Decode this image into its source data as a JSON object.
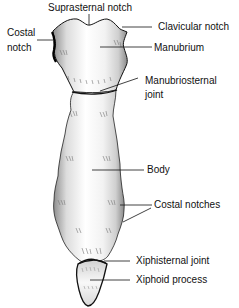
{
  "diagram": {
    "labels": {
      "suprasternal_notch": "Suprasternal notch",
      "clavicular_notch": "Clavicular notch",
      "costal_notch_line1": "Costal",
      "costal_notch_line2": "notch",
      "manubrium": "Manubrium",
      "manubriosternal_joint_line1": "Manubriosternal",
      "manubriosternal_joint_line2": "joint",
      "body": "Body",
      "costal_notches": "Costal notches",
      "xiphisternal_joint": "Xiphisternal joint",
      "xiphoid_process": "Xiphoid process"
    },
    "colors": {
      "outline": "#111111",
      "bone_fill": "#f4f4f4",
      "shade": "#9a9a9a",
      "background": "#ffffff"
    }
  }
}
